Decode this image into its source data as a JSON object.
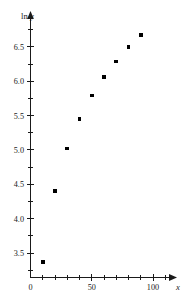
{
  "chart_data": {
    "type": "scatter",
    "title": "",
    "xlabel": "x",
    "ylabel": "ln y",
    "x": [
      10,
      20,
      30,
      40,
      50,
      60,
      70,
      80,
      90
    ],
    "values": [
      3.37,
      4.4,
      5.02,
      5.45,
      5.79,
      6.06,
      6.29,
      6.5,
      6.67
    ],
    "series": [
      {
        "name": "ln y",
        "x": [
          10,
          20,
          30,
          40,
          50,
          60,
          70,
          80,
          90
        ],
        "values": [
          3.37,
          4.4,
          5.02,
          5.45,
          5.79,
          6.06,
          6.29,
          6.5,
          6.67
        ]
      }
    ],
    "xlim": [
      0,
      110
    ],
    "ylim": [
      3.05,
      6.95
    ],
    "x_ticks_major": [
      0,
      50,
      100
    ],
    "x_tick_labels": [
      "0",
      "50",
      "100"
    ],
    "x_ticks_minor": [
      10,
      20,
      30,
      40,
      60,
      70,
      80,
      90,
      110
    ],
    "y_ticks_major": [
      3.5,
      4.0,
      4.5,
      5.0,
      5.5,
      6.0,
      6.5
    ],
    "y_tick_labels": [
      "3.5",
      "4.0",
      "4.5",
      "5.0",
      "5.5",
      "6.0",
      "6.5"
    ],
    "y_ticks_minor": [
      3.25,
      3.75,
      4.25,
      4.75,
      5.25,
      5.75,
      6.25,
      6.75
    ],
    "grid": false,
    "legend": false,
    "marker": "square",
    "marker_color": "#000000",
    "axis_color": "#1a1a1a",
    "background": "#ffffff",
    "axis_arrows": true
  },
  "labels": {
    "y_axis_title": "ln y",
    "x_axis_title": "x"
  }
}
